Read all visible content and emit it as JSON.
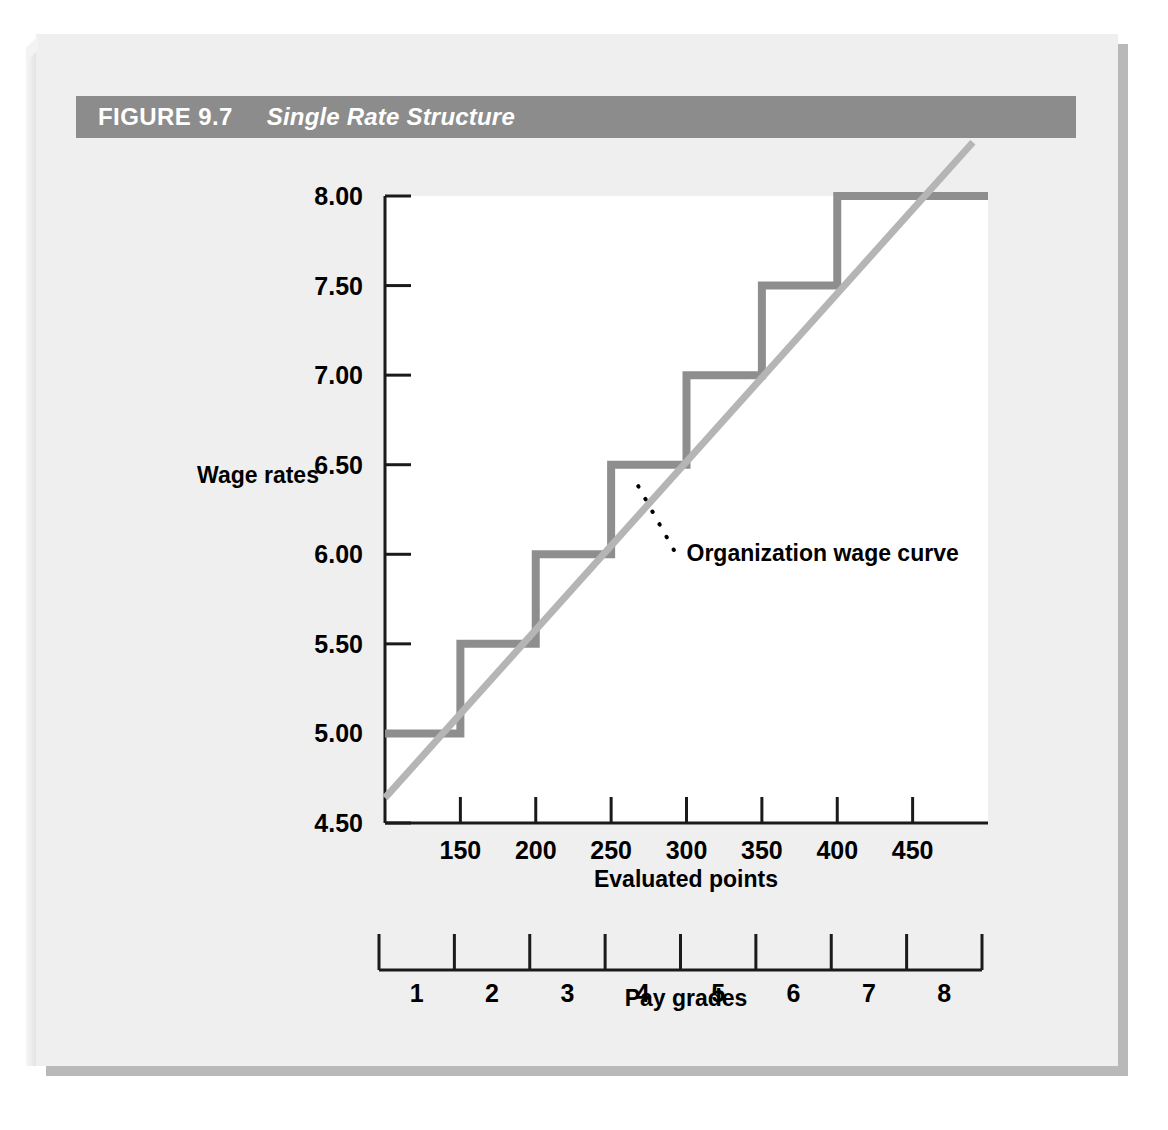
{
  "figure": {
    "number": "FIGURE 9.7",
    "title": "Single Rate Structure"
  },
  "colors": {
    "title_bar": "#8c8c8c",
    "page": "#efefef",
    "shadow": "#b9b9b9",
    "step_line": "#8e8e8e",
    "wage_curve": "#b5b5b5",
    "axis": "#1a1a1a",
    "text": "#000000",
    "plot_background": "#ffffff"
  },
  "chart_data": {
    "type": "line",
    "title": "Single Rate Structure",
    "xlabel": "Evaluated points",
    "ylabel": "Wage rates",
    "xlim": [
      100,
      500
    ],
    "ylim": [
      4.5,
      8.0
    ],
    "grid": false,
    "legend": "none",
    "x_ticks": [
      150,
      200,
      250,
      300,
      350,
      400,
      450
    ],
    "y_ticks": [
      "4.50",
      "5.00",
      "5.50",
      "6.00",
      "6.50",
      "7.00",
      "7.50",
      "8.00"
    ],
    "y_tick_values": [
      4.5,
      5.0,
      5.5,
      6.0,
      6.5,
      7.0,
      7.5,
      8.0
    ],
    "secondary_axis": {
      "label": "Pay grades",
      "ticks": [
        "1",
        "2",
        "3",
        "4",
        "5",
        "6",
        "7",
        "8"
      ],
      "boundaries": [
        100,
        150,
        200,
        250,
        300,
        350,
        400,
        450,
        500
      ]
    },
    "series": [
      {
        "name": "Single rate structure",
        "type": "step",
        "color": "#8e8e8e",
        "points": [
          {
            "x": 100,
            "y": 5.0
          },
          {
            "x": 150,
            "y": 5.0
          },
          {
            "x": 150,
            "y": 5.5
          },
          {
            "x": 200,
            "y": 5.5
          },
          {
            "x": 200,
            "y": 6.0
          },
          {
            "x": 250,
            "y": 6.0
          },
          {
            "x": 250,
            "y": 6.5
          },
          {
            "x": 300,
            "y": 6.5
          },
          {
            "x": 300,
            "y": 7.0
          },
          {
            "x": 350,
            "y": 7.0
          },
          {
            "x": 350,
            "y": 7.5
          },
          {
            "x": 400,
            "y": 7.5
          },
          {
            "x": 400,
            "y": 8.0
          },
          {
            "x": 500,
            "y": 8.0
          }
        ],
        "grade_rates": [
          {
            "grade": 1,
            "rate": 5.0
          },
          {
            "grade": 2,
            "rate": 5.5
          },
          {
            "grade": 3,
            "rate": 6.0
          },
          {
            "grade": 4,
            "rate": 6.5
          },
          {
            "grade": 5,
            "rate": 7.0
          },
          {
            "grade": 6,
            "rate": 7.5
          },
          {
            "grade": 7,
            "rate": 8.0
          },
          {
            "grade": 8,
            "rate": 8.0
          }
        ]
      },
      {
        "name": "Organization wage curve",
        "type": "line",
        "color": "#b5b5b5",
        "points": [
          {
            "x": 100,
            "y": 4.64
          },
          {
            "x": 490,
            "y": 8.3
          }
        ]
      }
    ],
    "annotations": [
      {
        "text": "Organization wage curve",
        "target_x": 268,
        "target_y": 6.38,
        "label_x": 300,
        "label_y": 6.02
      }
    ]
  }
}
